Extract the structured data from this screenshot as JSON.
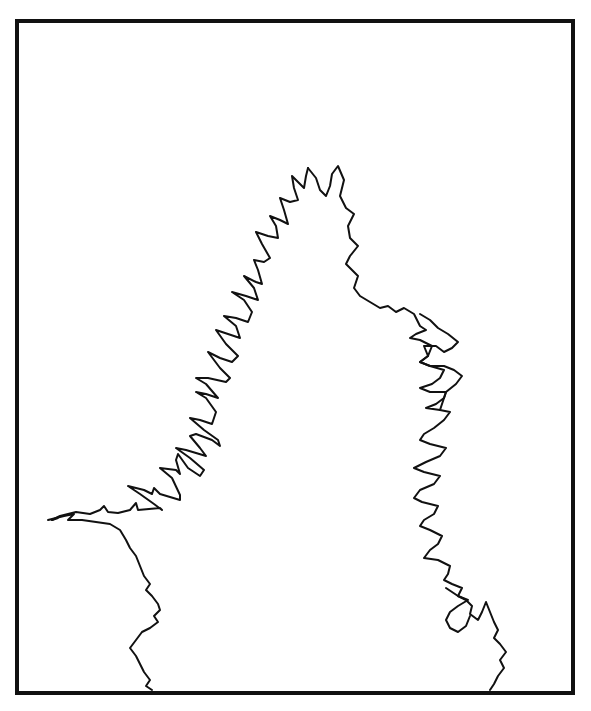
{
  "figure": {
    "colors": {
      "background": "#ffffff",
      "ink": "#111111"
    },
    "frame": {
      "x": 17,
      "y": 19,
      "width": 557,
      "height": 674
    },
    "left_branch": "52,520 60,516 76,512 90,514 100,510 104,506 108,512 118,513 130,510 136,503 138,510 160,508 162,510 154,504 140,494 128,486 144,490 152,494 154,488 160,494 180,500 180,495 172,478 160,468 176,470 180,474 176,460 178,454 188,468 200,476 204,470 190,458 176,448 186,450 206,456 200,448 190,436 196,434 212,440 220,446 218,440 204,430 190,418 200,420 212,424 216,412 206,398 196,392 206,394 218,398 206,384 196,378 208,378 226,382 230,378 220,368 208,352 220,358 232,362 238,356 226,344 216,330 228,334 240,338 236,326 224,316 236,318 248,322 252,312 244,300 232,292 246,296 258,300 254,288 244,276 256,282 262,284 258,270 254,260 264,262 270,258 262,244 256,232 268,236 278,238 276,226 270,216 280,220 288,224 284,210 280,198 290,202 298,200 294,188 292,176 298,182 304,188 306,176 308,168",
    "left_lower": "52,520 58,518 48,520 64,516 74,514 68,520 82,520 96,522 110,524 120,530 126,540 130,548 136,556 140,566 144,576 150,584 146,590 152,596 158,604 160,610 154,616 158,622 150,628 142,632 136,640 130,648 136,656 140,664 144,672 150,680 146,686 152,690",
    "right_branch": "308,168 316,178 320,190 326,196 330,186 332,174 338,166 344,180 340,196 346,208 354,214 348,226 350,238 358,246 350,256 346,264 352,270 358,276 354,288 360,296 370,302 380,308 388,306 396,312 404,308 414,314 420,326 426,330 416,334 410,338 420,340 432,346 428,356 420,362 430,366 444,370 440,378 432,384 420,388 430,392 446,392 444,398 436,404 426,408 440,410 450,412 444,420 434,428 424,434 420,440 430,444 446,448 440,456 426,462 414,468 424,472 440,476 434,484 420,490 414,498 422,502 438,506 434,514 424,520 420,526 430,530 442,536 438,544 430,550 424,558 438,560 450,566 448,574 444,580 452,584 462,588 458,596 466,600 472,606 470,614 478,620 482,612 486,602 490,612 494,622 498,630 494,638 500,644 506,652 500,660 504,668 498,676 494,684 490,690",
    "right_inner_loops": "440,410 446,392 456,384 462,376 454,370 444,366 430,366 420,362 428,356 424,346 436,346 444,352 452,348 458,342 448,334 438,328 430,320 420,314",
    "right_lower_loop": "446,588 458,596 468,600 458,606 450,612 446,620 450,628 458,632 466,626 470,616"
  }
}
